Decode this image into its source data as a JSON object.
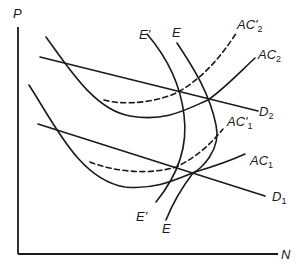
{
  "diagram": {
    "type": "economics-curve-diagram",
    "axes": {
      "y_label": "P",
      "x_label": "N"
    },
    "curves": [
      {
        "id": "D2",
        "label": "D",
        "sub": "2",
        "kind": "demand",
        "style": "solid"
      },
      {
        "id": "D1",
        "label": "D",
        "sub": "1",
        "kind": "demand",
        "style": "solid"
      },
      {
        "id": "AC2",
        "label": "AC",
        "sub": "2",
        "kind": "average-cost",
        "style": "solid"
      },
      {
        "id": "AC2p",
        "label": "AC'",
        "sub": "2",
        "kind": "average-cost",
        "style": "dashed"
      },
      {
        "id": "AC1",
        "label": "AC",
        "sub": "1",
        "kind": "average-cost",
        "style": "solid"
      },
      {
        "id": "AC1p",
        "label": "AC'",
        "sub": "1",
        "kind": "average-cost",
        "style": "dashed"
      },
      {
        "id": "E",
        "label": "E",
        "kind": "equilibrium-locus",
        "style": "solid"
      },
      {
        "id": "Ep",
        "label": "E'",
        "kind": "equilibrium-locus",
        "style": "solid"
      }
    ],
    "colors": {
      "line": "#1a1a1a",
      "background": "#ffffff"
    }
  }
}
